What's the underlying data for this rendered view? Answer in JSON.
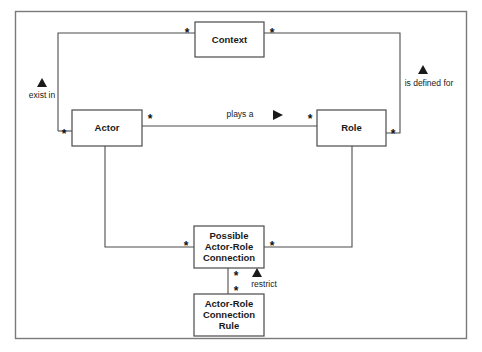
{
  "diagram": {
    "kind": "uml-class-diagram",
    "frame": {
      "label": "diagram-frame"
    },
    "classes": [
      {
        "id": "context",
        "name": "Context",
        "lines": [
          "Context"
        ],
        "x": 195,
        "y": 22,
        "w": 69,
        "h": 35
      },
      {
        "id": "actor",
        "name": "Actor",
        "lines": [
          "Actor"
        ],
        "x": 72,
        "y": 110,
        "w": 70,
        "h": 36
      },
      {
        "id": "role",
        "name": "Role",
        "lines": [
          "Role"
        ],
        "x": 317,
        "y": 110,
        "w": 69,
        "h": 36
      },
      {
        "id": "possible-actor-role-connection",
        "name": "Possible Actor-Role Connection",
        "lines": [
          "Possible",
          "Actor-Role",
          "Connection"
        ],
        "x": 194,
        "y": 226,
        "w": 70,
        "h": 42
      },
      {
        "id": "actor-role-connection-rule",
        "name": "Actor-Role Connection Rule",
        "lines": [
          "Actor-Role",
          "Connection",
          "Rule"
        ],
        "x": 194,
        "y": 294,
        "w": 70,
        "h": 42
      }
    ],
    "associations": [
      {
        "id": "actor-exist-in-context",
        "label": "exist in",
        "from": "actor",
        "to": "context",
        "from_multiplicity": "*",
        "to_multiplicity": "*",
        "direction_marker": "triangle-up"
      },
      {
        "id": "role-is-defined-for-context",
        "label": "is defined for",
        "from": "role",
        "to": "context",
        "from_multiplicity": "*",
        "to_multiplicity": "*",
        "direction_marker": "triangle-up"
      },
      {
        "id": "actor-plays-a-role",
        "label": "plays a",
        "from": "actor",
        "to": "role",
        "from_multiplicity": "*",
        "to_multiplicity": "*",
        "direction_marker": "triangle-right"
      },
      {
        "id": "actor-possible-connection",
        "label": "",
        "from": "actor",
        "to": "possible-actor-role-connection",
        "from_multiplicity": "",
        "to_multiplicity": "*",
        "direction_marker": "none"
      },
      {
        "id": "role-possible-connection",
        "label": "",
        "from": "role",
        "to": "possible-actor-role-connection",
        "from_multiplicity": "",
        "to_multiplicity": "*",
        "direction_marker": "none"
      },
      {
        "id": "rule-restrict-possible-connection",
        "label": "restrict",
        "from": "actor-role-connection-rule",
        "to": "possible-actor-role-connection",
        "from_multiplicity": "*",
        "to_multiplicity": "*",
        "direction_marker": "triangle-up"
      }
    ],
    "multiplicity_markers": [
      {
        "id": "mult-context-left",
        "text": "*",
        "x": 187,
        "y": 33
      },
      {
        "id": "mult-context-right",
        "text": "*",
        "x": 272,
        "y": 33
      },
      {
        "id": "mult-actor-left",
        "text": "*",
        "x": 64,
        "y": 134
      },
      {
        "id": "mult-actor-right",
        "text": "*",
        "x": 150,
        "y": 119
      },
      {
        "id": "mult-role-left",
        "text": "*",
        "x": 310,
        "y": 119
      },
      {
        "id": "mult-role-right",
        "text": "*",
        "x": 393,
        "y": 134
      },
      {
        "id": "mult-possible-left",
        "text": "*",
        "x": 186,
        "y": 246
      },
      {
        "id": "mult-possible-right",
        "text": "*",
        "x": 272,
        "y": 246
      },
      {
        "id": "mult-possible-bottom",
        "text": "*",
        "x": 236,
        "y": 276
      },
      {
        "id": "mult-rule-top",
        "text": "*",
        "x": 236,
        "y": 291
      }
    ],
    "text_labels": [
      {
        "id": "label-exist-in",
        "text": "exist in",
        "x": 42,
        "y": 96
      },
      {
        "id": "label-is-defined-for",
        "text": "is defined for",
        "x": 429,
        "y": 84
      },
      {
        "id": "label-plays-a",
        "text": "plays a",
        "x": 240,
        "y": 115
      },
      {
        "id": "label-restrict",
        "text": "restrict",
        "x": 264,
        "y": 285
      }
    ],
    "direction_triangles": [
      {
        "id": "triangle-exist-in",
        "kind": "up",
        "x": 42,
        "y": 83
      },
      {
        "id": "triangle-is-defined-for",
        "kind": "up",
        "x": 423,
        "y": 70
      },
      {
        "id": "triangle-plays-a",
        "kind": "right",
        "x": 277,
        "y": 115
      },
      {
        "id": "triangle-restrict",
        "kind": "up",
        "x": 257,
        "y": 273
      }
    ]
  }
}
